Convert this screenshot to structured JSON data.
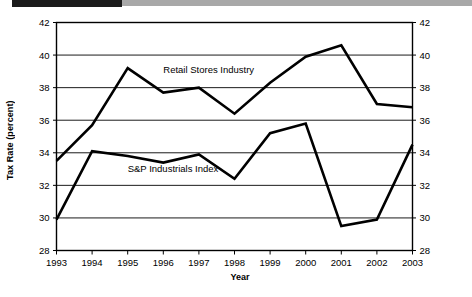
{
  "header": {
    "bar_black_color": "#1b1b1b",
    "bar_gray_color": "#a8a8a8"
  },
  "axis": {
    "y_title": "Tax Rate (percent)",
    "x_title": "Year"
  },
  "chart_data": {
    "type": "line",
    "title": "",
    "subtitle": "",
    "xlabel": "Year",
    "ylabel": "Tax Rate (percent)",
    "x": [
      "1993",
      "1994",
      "1995",
      "1996",
      "1997",
      "1998",
      "1999",
      "2000",
      "2001",
      "2002",
      "2003"
    ],
    "xlim": [
      "1993",
      "2003"
    ],
    "ylim": [
      28,
      42
    ],
    "yticks": [
      28,
      30,
      32,
      34,
      36,
      38,
      40,
      42
    ],
    "ytick_labels": [
      "28",
      "30",
      "32",
      "34",
      "36",
      "38",
      "40",
      "42"
    ],
    "ytick_labels_right": [
      "28",
      "30",
      "32",
      "34",
      "36",
      "38",
      "40",
      "42"
    ],
    "xtick_labels": [
      "1993",
      "1994",
      "1995",
      "1996",
      "1997",
      "1998",
      "1999",
      "2000",
      "2001",
      "2002",
      "2003"
    ],
    "grid": true,
    "grid_axis": "y",
    "legend": "inline-annotations",
    "line_color": "#000000",
    "series": [
      {
        "name": "Retail Stores Industry",
        "label_position": "above-line",
        "values": [
          33.5,
          35.7,
          39.2,
          37.7,
          38.0,
          36.4,
          38.3,
          39.9,
          40.6,
          37.0,
          36.8
        ]
      },
      {
        "name": "S&P Industrials Index",
        "label_position": "below-line",
        "values": [
          29.9,
          34.1,
          33.8,
          33.4,
          33.9,
          32.4,
          35.2,
          35.8,
          29.5,
          29.9,
          34.5
        ]
      }
    ],
    "annotations": [
      {
        "text": "Retail Stores Industry",
        "x": "1996",
        "y": 38.9
      },
      {
        "text": "S&P Industrials Index",
        "x": "1995",
        "y": 32.8
      }
    ]
  }
}
